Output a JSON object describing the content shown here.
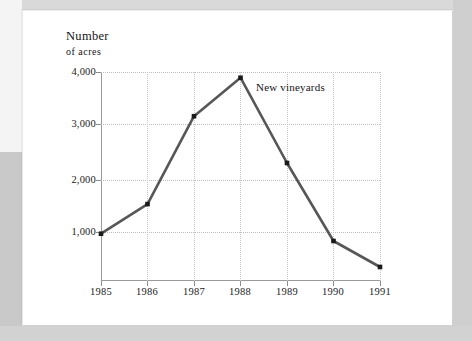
{
  "chart_data": {
    "type": "line",
    "title": "",
    "subtitle": "",
    "xlabel": "",
    "ylabel": "Number of acres",
    "ylabel_lines": [
      "Number",
      "of acres"
    ],
    "categories": [
      "1985",
      "1986",
      "1987",
      "1988",
      "1989",
      "1990",
      "1991"
    ],
    "x": [
      1985,
      1986,
      1987,
      1988,
      1989,
      1990,
      1991
    ],
    "values": [
      890,
      1460,
      3150,
      3890,
      2250,
      750,
      250
    ],
    "series": [
      {
        "name": "New vineyards",
        "values": [
          890,
          1460,
          3150,
          3890,
          2250,
          750,
          250
        ]
      }
    ],
    "annotations": [
      {
        "text": "New vineyards",
        "x": 1988,
        "y": 3700
      }
    ],
    "ylim": [
      0,
      4300
    ],
    "ytick_values": [
      1000,
      2000,
      3000,
      4000
    ],
    "ytick_labels": [
      "1,000",
      "2,000",
      "3,000",
      "4,000"
    ],
    "xtick_labels": [
      "1985",
      "1986",
      "1987",
      "1988",
      "1989",
      "1990",
      "1991"
    ],
    "grid": true,
    "grid_style": "dotted",
    "legend_position": "none",
    "markers": "filled-square",
    "colors": {
      "line": "#575757",
      "marker": "#1a1a1a",
      "grid": "#c2c2c2",
      "axis": "#8c8c8c",
      "text": "#141414",
      "card_background": "#ffffff",
      "page_background": "#d4d4d4"
    }
  },
  "annotation": {
    "label": "New vineyards"
  },
  "axis_title": {
    "line1": "Number",
    "line2": "of acres",
    "line1_cap": "N",
    "line1_rest": "umber",
    "line2_cap": "",
    "line2_rest": "of acres"
  }
}
